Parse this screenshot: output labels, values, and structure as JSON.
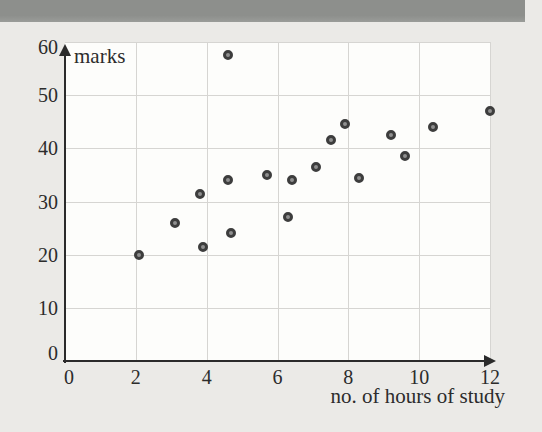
{
  "chart_data": {
    "type": "scatter",
    "title": "",
    "ylabel": "marks",
    "xlabel": "no. of hours of study",
    "xlim": [
      0,
      12
    ],
    "ylim": [
      0,
      60
    ],
    "x_ticks": [
      0,
      2,
      4,
      6,
      8,
      10,
      12
    ],
    "y_ticks": [
      0,
      10,
      20,
      30,
      40,
      50,
      60
    ],
    "grid": true,
    "legend": "none",
    "points": [
      [
        2.1,
        20
      ],
      [
        3.1,
        26
      ],
      [
        3.8,
        31.5
      ],
      [
        3.9,
        21.5
      ],
      [
        4.6,
        57.5
      ],
      [
        4.6,
        34
      ],
      [
        4.7,
        24
      ],
      [
        5.7,
        35
      ],
      [
        6.3,
        27
      ],
      [
        6.4,
        34
      ],
      [
        7.1,
        36.5
      ],
      [
        7.5,
        41.5
      ],
      [
        7.9,
        44.5
      ],
      [
        8.3,
        34.5
      ],
      [
        9.2,
        42.5
      ],
      [
        9.6,
        38.5
      ],
      [
        10.4,
        44
      ],
      [
        12,
        47
      ]
    ]
  },
  "colors": {
    "top_bar_dark": "#8d8f8c",
    "top_bar_light": "#9a9c99",
    "page_bg": "#ebeae7",
    "plot_bg": "#fdfdfb",
    "grid": "#d6d5d2",
    "axis": "#2b2b2b",
    "point_ring": "#3d3d3d",
    "point_fill": "#8f8f8f",
    "text": "#2c2c2c"
  }
}
